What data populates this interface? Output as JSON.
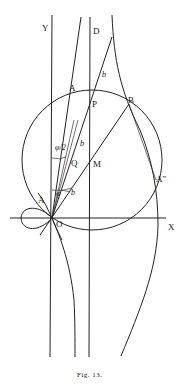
{
  "figure": {
    "caption": "Fig. 13.",
    "labels": {
      "Y": "Y",
      "D": "D",
      "X": "X",
      "O": "O",
      "A_top": "A",
      "A_left": "A",
      "A_dbl": "A″",
      "B": "B",
      "P": "P",
      "Q": "Q",
      "M": "M",
      "b1": "b",
      "b2": "b",
      "b3": "b",
      "phi_half": "φ/2",
      "phi": "φ"
    }
  }
}
